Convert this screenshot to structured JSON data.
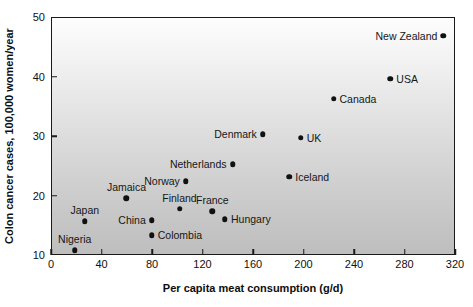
{
  "chart_data": {
    "type": "scatter",
    "title": "",
    "xlabel": "Per capita meat consumption (g/d)",
    "ylabel": "Colon cancer cases, 100,000 women/year",
    "xlim": [
      0,
      320
    ],
    "ylim": [
      10,
      50
    ],
    "xticks": [
      0,
      40,
      80,
      120,
      160,
      200,
      240,
      280,
      320
    ],
    "yticks": [
      10,
      20,
      30,
      40,
      50
    ],
    "grid": false,
    "legend": "none",
    "points": [
      {
        "label": "Nigeria",
        "x": 18,
        "y": 11.0,
        "label_pos": "above"
      },
      {
        "label": "Japan",
        "x": 26,
        "y": 15.8,
        "label_pos": "above"
      },
      {
        "label": "China",
        "x": 79,
        "y": 16.0,
        "label_pos": "left"
      },
      {
        "label": "Colombia",
        "x": 79,
        "y": 13.5,
        "label_pos": "right"
      },
      {
        "label": "Jamaica",
        "x": 59,
        "y": 19.7,
        "label_pos": "above"
      },
      {
        "label": "Finland",
        "x": 101,
        "y": 17.9,
        "label_pos": "above"
      },
      {
        "label": "Norway",
        "x": 106,
        "y": 22.6,
        "label_pos": "left"
      },
      {
        "label": "Netherlands",
        "x": 143,
        "y": 25.4,
        "label_pos": "left"
      },
      {
        "label": "France",
        "x": 127,
        "y": 17.5,
        "label_pos": "above"
      },
      {
        "label": "Hungary",
        "x": 137,
        "y": 16.2,
        "label_pos": "right"
      },
      {
        "label": "Denmark",
        "x": 167,
        "y": 30.5,
        "label_pos": "left"
      },
      {
        "label": "UK",
        "x": 197,
        "y": 29.9,
        "label_pos": "right"
      },
      {
        "label": "Iceland",
        "x": 188,
        "y": 23.3,
        "label_pos": "right"
      },
      {
        "label": "Canada",
        "x": 223,
        "y": 36.4,
        "label_pos": "right"
      },
      {
        "label": "USA",
        "x": 268,
        "y": 39.8,
        "label_pos": "right"
      },
      {
        "label": "New Zealand",
        "x": 310,
        "y": 47.0,
        "label_pos": "left"
      }
    ],
    "colors": {
      "marker": "#111111",
      "frame": "#1a1a1a",
      "plot_bg_top": "#fdfdfd",
      "plot_bg_bottom": "#bebebe",
      "text": "#111111"
    }
  }
}
